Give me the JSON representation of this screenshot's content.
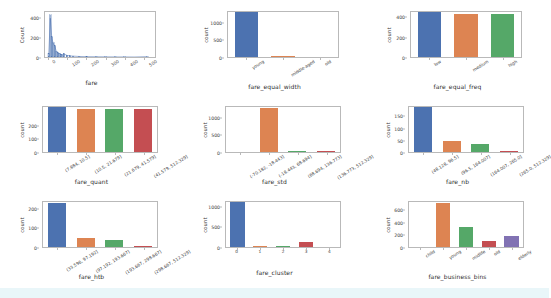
{
  "figure": {
    "background": "#ffffff",
    "band_color": "#e9f6f9",
    "rows": 3,
    "cols": 3
  },
  "palette": {
    "blue": "#4c72b0",
    "orange": "#dd8452",
    "green": "#55a868",
    "red": "#c44e52",
    "purple": "#8172b3",
    "axis": "#b9b9b9",
    "text": "#3a3a3a"
  },
  "chart_data": [
    {
      "type": "line",
      "name": "fare-histogram",
      "title": "",
      "xlabel": "fare",
      "ylabel": "Count",
      "xlim": [
        -20,
        560
      ],
      "ylim": [
        0,
        470
      ],
      "xticks": [
        "0",
        "100",
        "200",
        "300",
        "400",
        "500"
      ],
      "xtick_values": [
        0,
        100,
        200,
        300,
        400,
        500
      ],
      "yticks": [
        "0",
        "200",
        "400"
      ],
      "ytick_values": [
        0,
        200,
        400
      ],
      "grid": false,
      "legend": "none",
      "series": [
        {
          "name": "fare count",
          "x": [
            0,
            8,
            16,
            24,
            32,
            40,
            48,
            56,
            64,
            72,
            80,
            96,
            112,
            128,
            160,
            200,
            250,
            300,
            350,
            400,
            450,
            520
          ],
          "values": [
            40,
            440,
            210,
            150,
            120,
            60,
            45,
            40,
            30,
            25,
            35,
            18,
            12,
            10,
            6,
            4,
            3,
            2,
            1,
            1,
            0,
            4
          ]
        }
      ]
    },
    {
      "type": "bar",
      "name": "fare-equal-width",
      "title": "",
      "xlabel": "fare_equal_width",
      "ylabel": "count",
      "categories": [
        "young",
        "middle-aged",
        "old"
      ],
      "values": [
        1265,
        15,
        2
      ],
      "colors": [
        "#4c72b0",
        "#dd8452",
        "#55a868"
      ],
      "yticks": [
        "0",
        "500",
        "1000"
      ],
      "ytick_values": [
        0,
        500,
        1000
      ],
      "ylim": [
        0,
        1330
      ],
      "rotate_xticks": true,
      "grid": false,
      "legend": "none"
    },
    {
      "type": "bar",
      "name": "fare-equal-freq",
      "title": "",
      "xlabel": "fare_equal_freq",
      "ylabel": "count",
      "categories": [
        "low",
        "medium",
        "high"
      ],
      "values": [
        440,
        425,
        425
      ],
      "colors": [
        "#4c72b0",
        "#dd8452",
        "#55a868"
      ],
      "yticks": [
        "0",
        "200",
        "400"
      ],
      "ytick_values": [
        0,
        200,
        400
      ],
      "ylim": [
        0,
        463
      ],
      "rotate_xticks": true,
      "grid": false,
      "legend": "none"
    },
    {
      "type": "bar",
      "name": "fare-quant",
      "title": "",
      "xlabel": "fare_quant",
      "ylabel": "count",
      "categories": [
        "(7.884, 10.5]",
        "(10.5, 21.679]",
        "(21.679, 41.579]",
        "(41.579, 512.329]"
      ],
      "values": [
        330,
        318,
        320,
        318
      ],
      "colors": [
        "#4c72b0",
        "#dd8452",
        "#55a868",
        "#c44e52"
      ],
      "yticks": [
        "0",
        "100",
        "200"
      ],
      "ytick_values": [
        0,
        100,
        200
      ],
      "ylim": [
        0,
        347
      ],
      "rotate_xticks": true,
      "grid": false,
      "legend": "none"
    },
    {
      "type": "bar",
      "name": "fare-std",
      "title": "",
      "xlabel": "fare_std",
      "ylabel": "count",
      "categories": [
        "(-70.182, -18.443]",
        "(-18.443, 68.694]",
        "(68.694, 136.773]",
        "(136.773, 512.329]"
      ],
      "values": [
        1,
        1240,
        25,
        20
      ],
      "colors": [
        "#4c72b0",
        "#dd8452",
        "#55a868",
        "#c44e52"
      ],
      "yticks": [
        "0",
        "500",
        "1000"
      ],
      "ytick_values": [
        0,
        500,
        1000
      ],
      "ylim": [
        0,
        1330
      ],
      "rotate_xticks": true,
      "grid": false,
      "legend": "none"
    },
    {
      "type": "bar",
      "name": "fare-nb",
      "title": "",
      "xlabel": "fare_nb",
      "ylabel": "count",
      "categories": [
        "(48.128, 96.5]",
        "(96.5, 164.007]",
        "(164.007, 265.0]",
        "(265.0, 512.329]"
      ],
      "values": [
        182,
        46,
        34,
        5
      ],
      "colors": [
        "#4c72b0",
        "#dd8452",
        "#55a868",
        "#c44e52"
      ],
      "yticks": [
        "0",
        "50",
        "100",
        "150"
      ],
      "ytick_values": [
        0,
        50,
        100,
        150
      ],
      "ylim": [
        0,
        192
      ],
      "rotate_xticks": true,
      "grid": false,
      "legend": "none"
    },
    {
      "type": "bar",
      "name": "fare-htb",
      "title": "",
      "xlabel": "fare_htb",
      "ylabel": "count",
      "categories": [
        "(33.596, 97.192]",
        "(97.192, 193.667]",
        "(193.667, 298.667]",
        "(298.667, 512.329]"
      ],
      "values": [
        222,
        48,
        36,
        5
      ],
      "colors": [
        "#4c72b0",
        "#dd8452",
        "#55a868",
        "#c44e52"
      ],
      "yticks": [
        "0",
        "100",
        "200"
      ],
      "ytick_values": [
        0,
        100,
        200
      ],
      "ylim": [
        0,
        238
      ],
      "rotate_xticks": true,
      "grid": false,
      "legend": "none"
    },
    {
      "type": "bar",
      "name": "fare-cluster",
      "title": "",
      "xlabel": "fare_cluster",
      "ylabel": "count",
      "categories": [
        "0",
        "1",
        "2",
        "3",
        "4"
      ],
      "values": [
        1080,
        35,
        22,
        115,
        2
      ],
      "colors": [
        "#4c72b0",
        "#dd8452",
        "#55a868",
        "#c44e52",
        "#8172b3"
      ],
      "yticks": [
        "0",
        "500",
        "1000"
      ],
      "ytick_values": [
        0,
        500,
        1000
      ],
      "ylim": [
        0,
        1140
      ],
      "rotate_xticks": false,
      "grid": false,
      "legend": "none"
    },
    {
      "type": "bar",
      "name": "fare-business-bins",
      "title": "",
      "xlabel": "fare_business_bins",
      "ylabel": "count",
      "categories": [
        "child",
        "young",
        "midlife",
        "old",
        "elderly"
      ],
      "values": [
        2,
        690,
        320,
        100,
        175
      ],
      "colors": [
        "#4c72b0",
        "#dd8452",
        "#55a868",
        "#c44e52",
        "#8172b3"
      ],
      "yticks": [
        "0",
        "200",
        "400",
        "600"
      ],
      "ytick_values": [
        0,
        200,
        400,
        600
      ],
      "ylim": [
        0,
        740
      ],
      "rotate_xticks": true,
      "grid": false,
      "legend": "none"
    }
  ]
}
